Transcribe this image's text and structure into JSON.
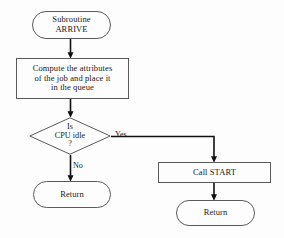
{
  "diagram": {
    "type": "flowchart",
    "colors": {
      "background": "#fdfdfd",
      "stroke": "#5a5a5a",
      "arrow": "#111111",
      "text": "#1a1a1a"
    },
    "nodes": {
      "start": {
        "shape": "terminal",
        "text": "Subroutine\nARRIVE"
      },
      "compute": {
        "shape": "process",
        "text": "Compute the attributes\nof the job and place it\nin the queue"
      },
      "decision": {
        "shape": "diamond",
        "text": "Is\nCPU idle\n?"
      },
      "return_left": {
        "shape": "terminal",
        "text": "Return"
      },
      "call_start": {
        "shape": "process",
        "text": "Call START"
      },
      "return_right": {
        "shape": "terminal",
        "text": "Return"
      }
    },
    "edges": {
      "yes_label": "Yes",
      "no_label": "No"
    }
  }
}
